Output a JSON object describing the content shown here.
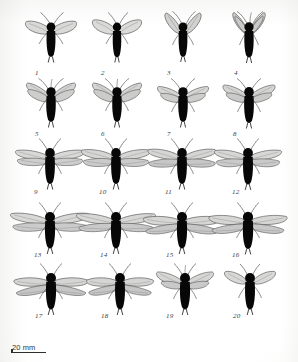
{
  "figure": {
    "type": "scientific-specimen-plate",
    "caption_numbers_style": "italic",
    "background_color": "#ffffff",
    "body_color": "#0a0a0a",
    "wing_fill": "#d6d6d4",
    "wing_stroke": "#5a5a58",
    "appendage_color": "#5f5f5d",
    "rows": 5,
    "columns": 4,
    "total_specimens": 20
  },
  "scale_bar": {
    "label": "20 mm",
    "bar_length_px": 34
  },
  "specimens": [
    {
      "num": "1",
      "wing_span": "narrow",
      "wing_angle": "upswept",
      "wing_pairs": 1,
      "antennae": 2,
      "cerci": 1
    },
    {
      "num": "2",
      "wing_span": "narrow",
      "wing_angle": "upswept",
      "wing_pairs": 1,
      "antennae": 2,
      "cerci": 1
    },
    {
      "num": "3",
      "wing_span": "narrow",
      "wing_angle": "steep-upswept",
      "wing_pairs": 1,
      "antennae": 2,
      "cerci": 1
    },
    {
      "num": "4",
      "wing_span": "narrow",
      "wing_angle": "rayed-upswept",
      "wing_pairs": 2,
      "antennae": 3,
      "cerci": 2
    },
    {
      "num": "5",
      "wing_span": "medium",
      "wing_angle": "upswept",
      "wing_pairs": 2,
      "antennae": 3,
      "cerci": 2
    },
    {
      "num": "6",
      "wing_span": "medium",
      "wing_angle": "upswept",
      "wing_pairs": 2,
      "antennae": 3,
      "cerci": 2
    },
    {
      "num": "7",
      "wing_span": "medium",
      "wing_angle": "half-spread",
      "wing_pairs": 2,
      "antennae": 2,
      "cerci": 2
    },
    {
      "num": "8",
      "wing_span": "medium",
      "wing_angle": "half-spread",
      "wing_pairs": 2,
      "antennae": 2,
      "cerci": 2
    },
    {
      "num": "9",
      "wing_span": "wide",
      "wing_angle": "horizontal",
      "wing_pairs": 2,
      "antennae": 2,
      "cerci": 2
    },
    {
      "num": "10",
      "wing_span": "wide",
      "wing_angle": "horizontal",
      "wing_pairs": 2,
      "antennae": 2,
      "cerci": 2
    },
    {
      "num": "11",
      "wing_span": "wide",
      "wing_angle": "horizontal",
      "wing_pairs": 2,
      "antennae": 2,
      "cerci": 2
    },
    {
      "num": "12",
      "wing_span": "wide",
      "wing_angle": "horizontal",
      "wing_pairs": 2,
      "antennae": 2,
      "cerci": 2
    },
    {
      "num": "13",
      "wing_span": "very-wide",
      "wing_angle": "horizontal",
      "wing_pairs": 2,
      "antennae": 2,
      "cerci": 2
    },
    {
      "num": "14",
      "wing_span": "very-wide",
      "wing_angle": "horizontal",
      "wing_pairs": 2,
      "antennae": 2,
      "cerci": 2
    },
    {
      "num": "15",
      "wing_span": "very-wide",
      "wing_angle": "drooping",
      "wing_pairs": 2,
      "antennae": 2,
      "cerci": 2
    },
    {
      "num": "16",
      "wing_span": "very-wide",
      "wing_angle": "drooping",
      "wing_pairs": 2,
      "antennae": 2,
      "cerci": 2
    },
    {
      "num": "17",
      "wing_span": "very-wide",
      "wing_angle": "drooping",
      "wing_pairs": 2,
      "antennae": 2,
      "cerci": 2
    },
    {
      "num": "18",
      "wing_span": "wide",
      "wing_angle": "drooping",
      "wing_pairs": 2,
      "antennae": 2,
      "cerci": 2
    },
    {
      "num": "19",
      "wing_span": "medium",
      "wing_angle": "half-spread",
      "wing_pairs": 2,
      "antennae": 3,
      "cerci": 2
    },
    {
      "num": "20",
      "wing_span": "medium",
      "wing_angle": "half-spread",
      "wing_pairs": 1,
      "antennae": 2,
      "cerci": 2
    }
  ]
}
